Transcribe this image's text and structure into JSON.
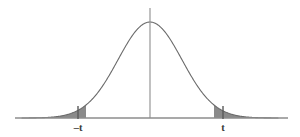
{
  "figure": {
    "name": "two-tailed-normal-distribution-curve",
    "background_color": "#ffffff",
    "width": 300,
    "height": 137
  },
  "chart_data": {
    "type": "area",
    "title": "",
    "subtitle": "",
    "xlabel": "",
    "ylabel": "",
    "grid": false,
    "legend": null,
    "curve_type": "normal-density",
    "xlim": [
      -4.0,
      4.0
    ],
    "ylim": [
      0,
      1.0
    ],
    "mean": 0,
    "peak_value": 1.0,
    "critical_values": [
      -2.0,
      2.0
    ],
    "shaded_regions": [
      {
        "name": "left-tail",
        "from": -4.0,
        "to": -2.0,
        "fill": "#8a8a8a"
      },
      {
        "name": "right-tail",
        "from": 2.0,
        "to": 4.0,
        "fill": "#8a8a8a"
      }
    ],
    "x": [
      -4.0,
      -3.75,
      -3.5,
      -3.25,
      -3.0,
      -2.75,
      -2.5,
      -2.25,
      -2.0,
      -1.75,
      -1.5,
      -1.25,
      -1.0,
      -0.75,
      -0.5,
      -0.25,
      0.0,
      0.25,
      0.5,
      0.75,
      1.0,
      1.25,
      1.5,
      1.75,
      2.0,
      2.25,
      2.5,
      2.75,
      3.0,
      3.25,
      3.5,
      3.75,
      4.0
    ],
    "values": [
      0.0003,
      0.0009,
      0.0022,
      0.0051,
      0.0111,
      0.0226,
      0.0439,
      0.0796,
      0.1353,
      0.2163,
      0.3247,
      0.4578,
      0.6065,
      0.7548,
      0.8825,
      0.9692,
      1.0,
      0.9692,
      0.8825,
      0.7548,
      0.6065,
      0.4578,
      0.3247,
      0.2163,
      0.1353,
      0.0796,
      0.0439,
      0.0226,
      0.0111,
      0.0051,
      0.0022,
      0.0009,
      0.0003
    ],
    "tick_labels": [
      "–t",
      "t"
    ],
    "tick_positions": [
      -2.0,
      2.0
    ]
  },
  "axis": {
    "name": "horizontal-axis",
    "color": "#8d8d8d",
    "y_pixel": 118,
    "x_start_pixel": 15,
    "x_end_pixel": 288
  },
  "center_line": {
    "name": "vertical-center-line",
    "color": "#8d8d8d",
    "x_pixel": 150,
    "y_top_pixel": 8,
    "y_bottom_pixel": 118
  },
  "curve": {
    "name": "bell-curve",
    "stroke_color": "#6b6b6b",
    "stroke_width": 1.1,
    "fill": "none"
  },
  "ticks": [
    {
      "name": "tick-negative-t",
      "label": "–t",
      "x_pixel": 78,
      "label_x_pixel": 78,
      "label_y_pixel": 130,
      "color": "#5a5a5a"
    },
    {
      "name": "tick-positive-t",
      "label": "t",
      "x_pixel": 223,
      "label_x_pixel": 223,
      "label_y_pixel": 130,
      "color": "#5a5a5a"
    }
  ],
  "colors": {
    "tail_fill": "#8a8a8a",
    "curve_stroke": "#6b6b6b",
    "axis": "#8d8d8d",
    "label_text": "#3a3a3a",
    "background": "#ffffff"
  }
}
